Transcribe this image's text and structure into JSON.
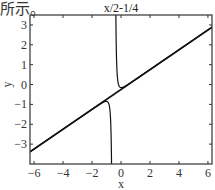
{
  "caption": "所示。",
  "chart_data": {
    "type": "line",
    "title": "x/2-1/4",
    "xlabel": "x",
    "ylabel": "y",
    "xlim": [
      -6.28,
      6.28
    ],
    "ylim": [
      -4,
      3.5
    ],
    "xticks": [
      -6,
      -4,
      -2,
      0,
      2,
      4,
      6
    ],
    "yticks": [
      -3,
      -2,
      -1,
      0,
      1,
      2,
      3
    ],
    "xtick_labels": [
      "−6",
      "−4",
      "−2",
      "0",
      "2",
      "4",
      "6"
    ],
    "ytick_labels": [
      "−3",
      "−2",
      "−1",
      "0",
      "1",
      "2",
      "3"
    ],
    "grid": false,
    "series": [
      {
        "name": "asymptote y = x/2 - 1/4",
        "slope": 0.5,
        "intercept": -0.25,
        "x": [
          -6.28,
          6.28
        ],
        "y": [
          -3.39,
          2.89
        ]
      },
      {
        "name": "curve right branch",
        "x": [
          -0.52,
          -0.5,
          -0.45,
          -0.4,
          -0.3,
          -0.2,
          0.0,
          0.5,
          1.0,
          2.0
        ],
        "y": [
          3.5,
          3.5,
          1.2,
          0.35,
          0.02,
          -0.05,
          -0.18,
          0.02,
          0.26,
          0.75
        ]
      },
      {
        "name": "curve left branch",
        "x": [
          -2.0,
          -1.5,
          -1.2,
          -0.9,
          -0.75,
          -0.65,
          -0.6,
          -0.58,
          -0.56
        ],
        "y": [
          -1.26,
          -1.02,
          -0.88,
          -0.95,
          -1.3,
          -2.2,
          -3.2,
          -3.7,
          -4.0
        ]
      }
    ],
    "vertical_asymptote_x": -0.5
  }
}
